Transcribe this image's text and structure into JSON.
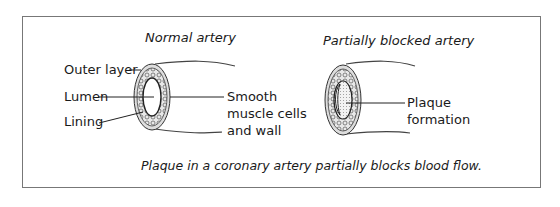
{
  "figure": {
    "caption": "Plaque in a coronary artery partially blocks blood flow.",
    "normal": {
      "title": "Normal artery",
      "labels": {
        "outer_layer": "Outer layer",
        "lumen": "Lumen",
        "lining": "Lining",
        "smooth_line1": "Smooth",
        "smooth_line2": "muscle cells",
        "smooth_line3": "and wall"
      }
    },
    "blocked": {
      "title": "Partially blocked artery",
      "labels": {
        "plaque_line1": "Plaque",
        "plaque_line2": "formation"
      }
    }
  }
}
